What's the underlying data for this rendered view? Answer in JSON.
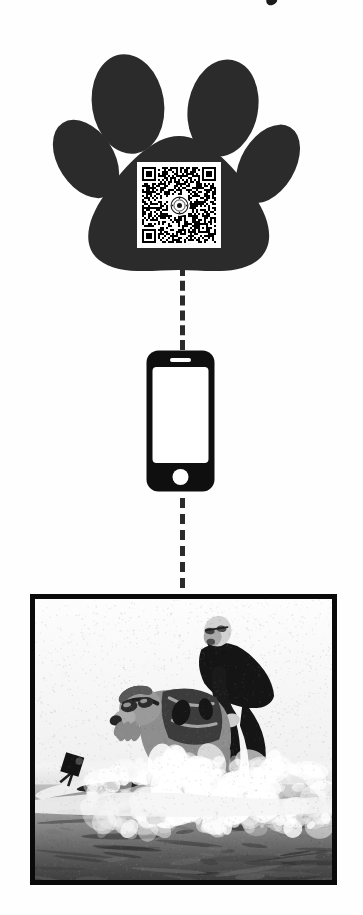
{
  "page": {
    "background_color": "#ffffff",
    "orientation": "vertical-flow-diagram"
  },
  "top_artifact": {
    "name": "cropped-glyph-fragment",
    "description": "Small dark cropped mark at very top edge of the image"
  },
  "step_1_paw": {
    "label": "dog-paw-print-with-qr-code",
    "fill_color": "#2b2b2b",
    "toe_pad_count": 4,
    "qr_code": {
      "label": "qr-code",
      "module_color": "#000000",
      "quiet_zone_color": "#ffffff",
      "center_logo": "circular-seal-crest-logo",
      "center_logo_description": "Small round emblem / official seal placed over the centre of the QR matrix"
    }
  },
  "connector_upper": {
    "label": "dashed-connector-paw-to-phone",
    "style": "dashed",
    "color": "#2b2b2b",
    "dash_count": 4
  },
  "step_2_phone": {
    "label": "smartphone-icon",
    "body_color": "#0f0f0f",
    "screen_color": "#ffffff",
    "features": [
      "earpiece-speaker-slot",
      "blank-screen",
      "round-home-button"
    ]
  },
  "connector_lower": {
    "label": "dashed-connector-phone-to-photo",
    "style": "dashed",
    "color": "#2b2b2b",
    "dash_count": 4
  },
  "step_3_photo": {
    "label": "framed-photograph",
    "frame_color": "#0a0a0a",
    "frame_width_px": 5,
    "color_mode": "black-and-white",
    "subject": "Man in a black wetsuit surfing a wave with a dog wearing goggles and a life vest",
    "elements": [
      "bald-man-with-glasses-in-wetsuit",
      "dog-wearing-dark-goggles",
      "dog-life-vest",
      "surfboard",
      "gopro-camera-on-board-nose",
      "breaking-white-water-spray",
      "blank-white-sky"
    ]
  }
}
